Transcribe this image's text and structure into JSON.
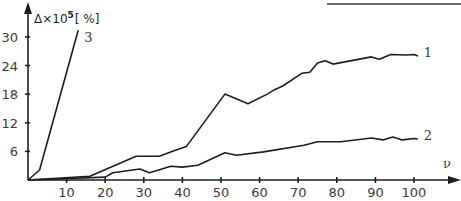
{
  "chart_data": {
    "type": "line",
    "title": "",
    "xlabel": "ν",
    "ylabel": "Δ×10⁵ [%]",
    "ylabel_parts": {
      "base": "Δ×10",
      "sup": "5",
      "unit": "[ %]"
    },
    "xlim": [
      0,
      105
    ],
    "ylim": [
      0,
      31
    ],
    "x_ticks": [
      10,
      20,
      30,
      40,
      50,
      60,
      70,
      80,
      90,
      100
    ],
    "y_ticks": [
      6,
      12,
      18,
      24,
      30
    ],
    "grid": false,
    "legend": "inline labels at line ends",
    "series": [
      {
        "name": "1",
        "points": [
          [
            0,
            0
          ],
          [
            16,
            0.8
          ],
          [
            28,
            5
          ],
          [
            34,
            5
          ],
          [
            38,
            6.2
          ],
          [
            41,
            7
          ],
          [
            51,
            18
          ],
          [
            57,
            16
          ],
          [
            62,
            18
          ],
          [
            64,
            19
          ],
          [
            66,
            19.7
          ],
          [
            71,
            22.4
          ],
          [
            73,
            22.6
          ],
          [
            75,
            24.5
          ],
          [
            77,
            25
          ],
          [
            79,
            24.3
          ],
          [
            89,
            25.8
          ],
          [
            91,
            25.3
          ],
          [
            94,
            26.3
          ],
          [
            98,
            26.2
          ],
          [
            100,
            26.3
          ],
          [
            101,
            26
          ]
        ]
      },
      {
        "name": "2",
        "points": [
          [
            0,
            0
          ],
          [
            20,
            0.6
          ],
          [
            22,
            1.5
          ],
          [
            29,
            2.3
          ],
          [
            31.5,
            1.5
          ],
          [
            37,
            2.9
          ],
          [
            40,
            2.7
          ],
          [
            44,
            3.1
          ],
          [
            51,
            5.7
          ],
          [
            54,
            5.2
          ],
          [
            61,
            5.9
          ],
          [
            71.5,
            7.3
          ],
          [
            75,
            8
          ],
          [
            81,
            8
          ],
          [
            89,
            8.8
          ],
          [
            92,
            8.4
          ],
          [
            94.5,
            9
          ],
          [
            97,
            8.4
          ],
          [
            100,
            8.7
          ],
          [
            101,
            8.6
          ]
        ]
      },
      {
        "name": "3",
        "points": [
          [
            0,
            0
          ],
          [
            3,
            2.1
          ],
          [
            13,
            31.4
          ]
        ]
      }
    ]
  },
  "decorations": {
    "top_rule": true
  }
}
